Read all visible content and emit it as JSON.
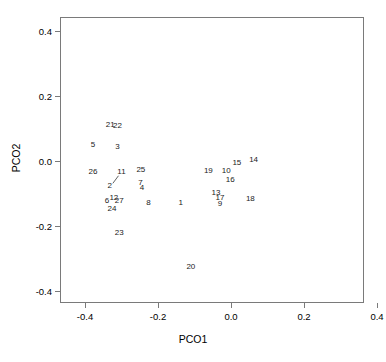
{
  "chart_data": {
    "type": "scatter",
    "title": "",
    "xlabel": "PCO1",
    "ylabel": "PCO2",
    "xlim": [
      -0.47,
      0.43
    ],
    "ylim": [
      -0.44,
      0.44
    ],
    "xticks": [
      "-0.4",
      "-0.2",
      "0.0",
      "0.2",
      "0.4"
    ],
    "xtick_values": [
      -0.4,
      -0.2,
      0.0,
      0.2,
      0.4
    ],
    "yticks": [
      "0.4",
      "0.2",
      "0.0",
      "-0.2",
      "-0.4"
    ],
    "ytick_values": [
      0.4,
      0.2,
      0.0,
      -0.2,
      -0.4
    ],
    "grid": false,
    "legend": false,
    "marker_style": "text-label",
    "points": [
      {
        "label": "1",
        "x": -0.138,
        "y": -0.129
      },
      {
        "label": "2",
        "x": -0.332,
        "y": -0.078
      },
      {
        "label": "3",
        "x": -0.311,
        "y": 0.043
      },
      {
        "label": "4",
        "x": -0.244,
        "y": -0.084
      },
      {
        "label": "5",
        "x": -0.378,
        "y": 0.049
      },
      {
        "label": "6",
        "x": -0.34,
        "y": -0.123
      },
      {
        "label": "7",
        "x": -0.248,
        "y": -0.068
      },
      {
        "label": "8",
        "x": -0.226,
        "y": -0.129
      },
      {
        "label": "9",
        "x": -0.03,
        "y": -0.132
      },
      {
        "label": "10",
        "x": -0.013,
        "y": -0.032
      },
      {
        "label": "11",
        "x": -0.3,
        "y": -0.033
      },
      {
        "label": "12",
        "x": -0.321,
        "y": -0.113
      },
      {
        "label": "13",
        "x": -0.041,
        "y": -0.098
      },
      {
        "label": "14",
        "x": 0.062,
        "y": 0.003
      },
      {
        "label": "15",
        "x": 0.016,
        "y": -0.005
      },
      {
        "label": "16",
        "x": -0.002,
        "y": -0.057
      },
      {
        "label": "17",
        "x": -0.03,
        "y": -0.113
      },
      {
        "label": "18",
        "x": 0.053,
        "y": -0.117
      },
      {
        "label": "19",
        "x": -0.062,
        "y": -0.031
      },
      {
        "label": "20",
        "x": -0.11,
        "y": -0.326
      },
      {
        "label": "21",
        "x": -0.331,
        "y": 0.112
      },
      {
        "label": "22",
        "x": -0.311,
        "y": 0.108
      },
      {
        "label": "23",
        "x": -0.306,
        "y": -0.222
      },
      {
        "label": "24",
        "x": -0.326,
        "y": -0.148
      },
      {
        "label": "25",
        "x": -0.247,
        "y": -0.027
      },
      {
        "label": "26",
        "x": -0.378,
        "y": -0.035
      },
      {
        "label": "27",
        "x": -0.306,
        "y": -0.124
      }
    ],
    "connectors": [
      {
        "from": "2",
        "to": "11"
      }
    ]
  },
  "axes": {
    "x_axis_label": "PCO1",
    "y_axis_label": "PCO2"
  }
}
